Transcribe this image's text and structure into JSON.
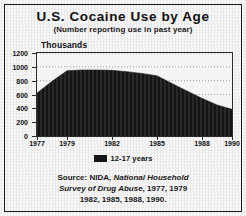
{
  "chart_data": {
    "type": "area",
    "title": "U.S. Cocaine Use by Age",
    "subtitle": "(Number reporting use in past year)",
    "units_label": "Thousands",
    "xlabel": "",
    "ylabel": "Thousands",
    "ylim": [
      0,
      1200
    ],
    "yticks": [
      0,
      200,
      400,
      600,
      800,
      1000,
      1200
    ],
    "ytick_labels": [
      "0",
      "200",
      "400",
      "600",
      "800",
      "1000",
      "1200"
    ],
    "grid": true,
    "xlim": [
      1977,
      1990
    ],
    "xticks": [
      1977,
      1979,
      1982,
      1985,
      1988,
      1990
    ],
    "xtick_labels": [
      "1977",
      "1979",
      "1982",
      "1985",
      "1988",
      "1990"
    ],
    "legend_position": "bottom",
    "series": [
      {
        "name": "12-17 years",
        "color": "#151515",
        "x": [
          1977,
          1978,
          1979,
          1980,
          1981,
          1982,
          1983,
          1984,
          1985,
          1986,
          1987,
          1988,
          1989,
          1990
        ],
        "values": [
          620,
          790,
          945,
          955,
          955,
          950,
          930,
          905,
          870,
          760,
          650,
          545,
          450,
          385
        ]
      }
    ]
  },
  "legend": {
    "entries": [
      {
        "label": "12-17 years",
        "color": "#151515"
      }
    ]
  },
  "source": {
    "lines": [
      "Source: NIDA, National Household",
      "Survey of Drug Abuse, 1977, 1979",
      "1982, 1985, 1988, 1990."
    ]
  },
  "colors": {
    "series_fill": "#151515",
    "frame": "#1a1a1a",
    "plot_border": "#2b2b2b",
    "text": "#111111",
    "plot_background": "#f4f4f4"
  }
}
